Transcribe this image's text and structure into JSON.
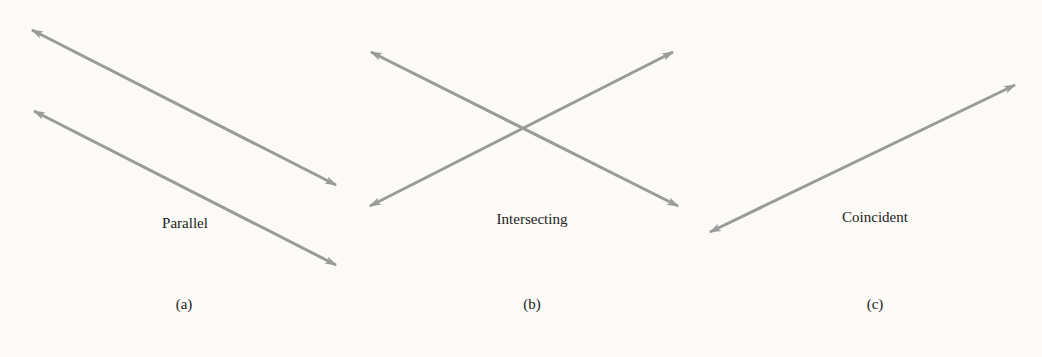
{
  "figure": {
    "line_color": "#9a9a9a",
    "background": "#fbfaf6",
    "panels": [
      {
        "id": "a",
        "title": "Parallel",
        "caption": "(a)",
        "lines": [
          {
            "x1": 32,
            "y1": 30,
            "x2": 336,
            "y2": 185
          },
          {
            "x1": 34,
            "y1": 111,
            "x2": 336,
            "y2": 265
          }
        ],
        "title_pos": {
          "x": 185,
          "y": 216
        },
        "caption_pos": {
          "x": 184,
          "y": 297
        }
      },
      {
        "id": "b",
        "title": "Intersecting",
        "caption": "(b)",
        "lines": [
          {
            "x1": 371,
            "y1": 52,
            "x2": 678,
            "y2": 206
          },
          {
            "x1": 370,
            "y1": 206,
            "x2": 673,
            "y2": 52
          }
        ],
        "title_pos": {
          "x": 532,
          "y": 212
        },
        "caption_pos": {
          "x": 532,
          "y": 297
        }
      },
      {
        "id": "c",
        "title": "Coincident",
        "caption": "(c)",
        "lines": [
          {
            "x1": 710,
            "y1": 232,
            "x2": 1015,
            "y2": 85
          }
        ],
        "title_pos": {
          "x": 875,
          "y": 210
        },
        "caption_pos": {
          "x": 875,
          "y": 297
        }
      }
    ]
  }
}
